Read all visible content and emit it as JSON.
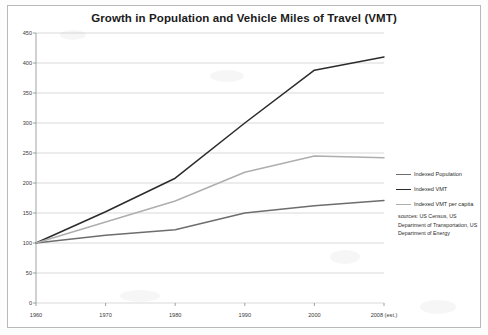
{
  "chart_data": {
    "type": "line",
    "title": "Growth in Population and Vehicle Miles of Travel (VMT)",
    "xlabel": "",
    "ylabel": "",
    "x": [
      "1960",
      "1970",
      "1980",
      "1990",
      "2000",
      "2008 (est.)"
    ],
    "xtick_labels": [
      "1960",
      "1970",
      "1980",
      "1990",
      "2000",
      "2008 (est.)"
    ],
    "ytick_labels": [
      "0",
      "50",
      "100",
      "150",
      "200",
      "250",
      "300",
      "350",
      "400",
      "450"
    ],
    "ylim": [
      0,
      450
    ],
    "ytick_step": 50,
    "grid": true,
    "legend_position": "right",
    "series": [
      {
        "name": "Indexed Population",
        "color": "#6d6d6d",
        "values": [
          100,
          113,
          122,
          150,
          162,
          171
        ]
      },
      {
        "name": "Indexed VMT",
        "color": "#2b2b2b",
        "values": [
          100,
          152,
          208,
          300,
          388,
          410
        ]
      },
      {
        "name": "Indexed VMT per capita",
        "color": "#aeaeae",
        "values": [
          100,
          135,
          170,
          218,
          245,
          242
        ]
      }
    ],
    "annotations": {
      "sources": "sources:  US Census, US Department of Transportation, US Department of Energy"
    }
  },
  "legend": {
    "items": [
      {
        "label": "Indexed Population",
        "color": "#6d6d6d"
      },
      {
        "label": "Indexed VMT",
        "color": "#2b2b2b"
      },
      {
        "label": "Indexed VMT per capita",
        "color": "#aeaeae"
      }
    ]
  },
  "colors": {
    "population": "#6d6d6d",
    "vmt": "#2b2b2b",
    "vmt_per_capita": "#aeaeae",
    "grid": "#c8c8c8",
    "axis": "#8a8a8a",
    "frame": "#b9b9b9",
    "text": "#2b2b2b"
  }
}
